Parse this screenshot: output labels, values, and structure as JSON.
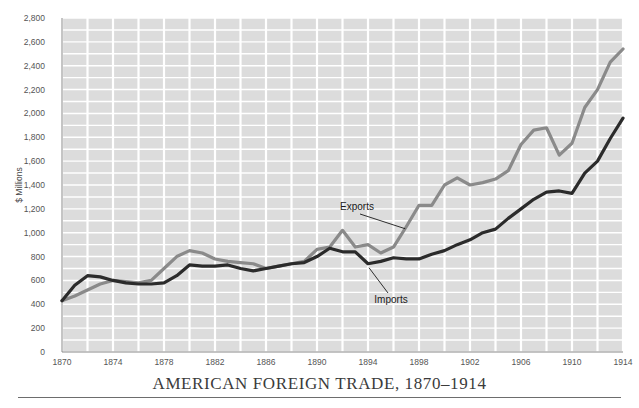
{
  "figure": {
    "title": "AMERICAN FOREIGN TRADE, 1870–1914",
    "y_axis_label": "$ Millions",
    "plot_bg_color": "#dcdcdc",
    "grid_color": "#ffffff",
    "page_bg_color": "#ffffff"
  },
  "annotations": {
    "exports_label": "Exports",
    "imports_label": "Imports"
  },
  "chart_data": {
    "type": "line",
    "title": "AMERICAN FOREIGN TRADE, 1870–1914",
    "xlabel": "",
    "ylabel": "$ Millions",
    "xlim": [
      1870,
      1914
    ],
    "ylim": [
      0,
      2800
    ],
    "grid": true,
    "legend_position": "inline-annotations",
    "x_ticks": [
      1870,
      1874,
      1878,
      1882,
      1886,
      1890,
      1894,
      1898,
      1902,
      1906,
      1910,
      1914
    ],
    "x_tick_labels": [
      "1870",
      "1874",
      "1878",
      "1882",
      "1886",
      "1890",
      "1894",
      "1898",
      "1902",
      "1906",
      "1910",
      "1914"
    ],
    "y_ticks": [
      0,
      200,
      400,
      600,
      800,
      1000,
      1200,
      1400,
      1600,
      1800,
      2000,
      2200,
      2400,
      2600,
      2800
    ],
    "y_tick_labels": [
      "0",
      "200",
      "400",
      "600",
      "800",
      "1,000",
      "1,200",
      "1,400",
      "1,600",
      "1,800",
      "2,000",
      "2,200",
      "2,400",
      "2,600",
      "2,800"
    ],
    "x": [
      1870,
      1871,
      1872,
      1873,
      1874,
      1875,
      1876,
      1877,
      1878,
      1879,
      1880,
      1881,
      1882,
      1883,
      1884,
      1885,
      1886,
      1887,
      1888,
      1889,
      1890,
      1891,
      1892,
      1893,
      1894,
      1895,
      1896,
      1897,
      1898,
      1899,
      1900,
      1901,
      1902,
      1903,
      1904,
      1905,
      1906,
      1907,
      1908,
      1909,
      1910,
      1911,
      1912,
      1913,
      1914
    ],
    "series": [
      {
        "name": "Exports",
        "color": "#8a8a8a",
        "values": [
          430,
          470,
          520,
          570,
          600,
          590,
          580,
          600,
          700,
          800,
          850,
          830,
          780,
          760,
          750,
          740,
          700,
          720,
          740,
          760,
          860,
          880,
          1020,
          880,
          900,
          830,
          880,
          1050,
          1230,
          1230,
          1400,
          1460,
          1400,
          1420,
          1450,
          1520,
          1740,
          1860,
          1880,
          1650,
          1750,
          2050,
          2200,
          2430,
          2540
        ]
      },
      {
        "name": "Imports",
        "color": "#2b2b2b",
        "values": [
          430,
          560,
          640,
          630,
          600,
          580,
          570,
          570,
          580,
          640,
          730,
          720,
          720,
          730,
          700,
          680,
          700,
          720,
          740,
          750,
          800,
          870,
          840,
          840,
          740,
          760,
          790,
          780,
          780,
          820,
          850,
          900,
          940,
          1000,
          1030,
          1120,
          1200,
          1280,
          1340,
          1350,
          1330,
          1500,
          1600,
          1790,
          1960
        ]
      }
    ]
  }
}
